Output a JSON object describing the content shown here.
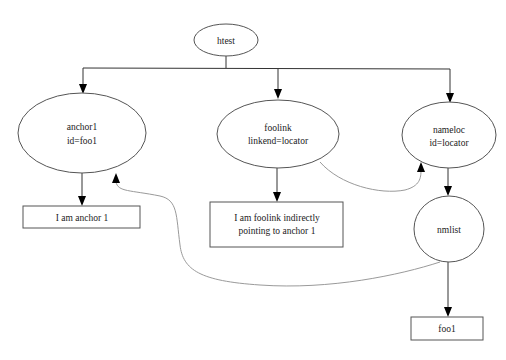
{
  "diagram": {
    "nodes": {
      "htest": {
        "shape": "ellipse",
        "lines": [
          "htest"
        ]
      },
      "anchor1": {
        "shape": "ellipse",
        "lines": [
          "anchor1",
          "id=foo1"
        ]
      },
      "foolink": {
        "shape": "ellipse",
        "lines": [
          "foolink",
          "linkend=locator"
        ]
      },
      "nameloc": {
        "shape": "ellipse",
        "lines": [
          "nameloc",
          "id=locator"
        ]
      },
      "nmlist": {
        "shape": "ellipse",
        "lines": [
          "nmlist"
        ]
      },
      "anchor_text": {
        "shape": "box",
        "lines": [
          "I am anchor 1"
        ]
      },
      "foolink_text": {
        "shape": "box",
        "lines": [
          "I am foolink indirectly",
          "pointing  to anchor 1"
        ]
      },
      "foo1": {
        "shape": "box",
        "lines": [
          "foo1"
        ]
      }
    },
    "edges": [
      {
        "from": "htest",
        "to": "anchor1",
        "style": "solid"
      },
      {
        "from": "htest",
        "to": "foolink",
        "style": "solid"
      },
      {
        "from": "htest",
        "to": "nameloc",
        "style": "solid"
      },
      {
        "from": "anchor1",
        "to": "anchor_text",
        "style": "solid"
      },
      {
        "from": "foolink",
        "to": "foolink_text",
        "style": "solid"
      },
      {
        "from": "nameloc",
        "to": "nmlist",
        "style": "solid"
      },
      {
        "from": "nmlist",
        "to": "foo1",
        "style": "solid"
      },
      {
        "from": "foolink",
        "to": "nameloc",
        "style": "reference"
      },
      {
        "from": "nmlist",
        "to": "anchor1",
        "style": "reference"
      }
    ],
    "colors": {
      "node_stroke": "#555555",
      "edge": "#333333",
      "reference_edge": "#9a9a9a",
      "background": "#ffffff"
    }
  }
}
